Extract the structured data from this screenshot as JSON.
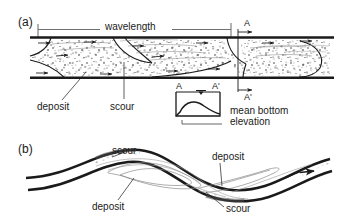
{
  "figure": {
    "type": "geomorphology-diagram",
    "background_color": "#ffffff",
    "line_color": "#1a1a1a",
    "stipple_color": "#333333"
  },
  "panel_a": {
    "label": "(a)",
    "view": "longitudinal profile of straight channel with alternate bars",
    "dimension_label": "wavelength",
    "section_marker_top": "A",
    "section_marker_bottom": "A'",
    "annotations": [
      {
        "text": "deposit",
        "target": "stippled bar body"
      },
      {
        "text": "scour",
        "target": "erosional trough surface"
      }
    ]
  },
  "inset": {
    "label_left": "A",
    "label_right": "A'",
    "caption_line1": "mean bottom",
    "caption_line2": "elevation",
    "water_surface_symbol": "water-level-triangle"
  },
  "panel_b": {
    "label": "(b)",
    "view": "plan view of meandering channel",
    "annotations": [
      {
        "text": "scour",
        "position": "upper-left outer bank"
      },
      {
        "text": "deposit",
        "position": "lower-left inner bank"
      },
      {
        "text": "deposit",
        "position": "upper-right inner bank"
      },
      {
        "text": "scour",
        "position": "lower-right outer bank"
      }
    ],
    "flow_arrow": "flow-direction-arrow"
  }
}
